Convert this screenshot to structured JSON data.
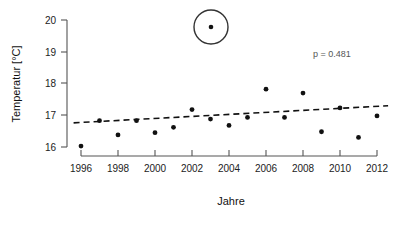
{
  "chart_data": {
    "type": "scatter",
    "title": "",
    "xlabel": "Jahre",
    "ylabel": "Temperatur [°C]",
    "xlim": [
      1995.2,
      2012.8
    ],
    "ylim": [
      15.72,
      20.0
    ],
    "grid": false,
    "legend": "none",
    "x_ticks": [
      1996,
      1998,
      2000,
      2002,
      2004,
      2006,
      2008,
      2010,
      2012
    ],
    "x_tick_labels": [
      "1996",
      "1998",
      "2000",
      "2002",
      "2004",
      "2006",
      "2008",
      "2010",
      "2012"
    ],
    "y_ticks": [
      16,
      17,
      18,
      19,
      20
    ],
    "y_tick_labels": [
      "16",
      "17",
      "18",
      "19",
      "20"
    ],
    "series": [
      {
        "name": "Jahresmitteltemperatur",
        "marker": "filled-circle",
        "color": "#111111",
        "x": [
          1996,
          1997,
          1998,
          1999,
          2000,
          2001,
          2002,
          2003,
          2004,
          2005,
          2006,
          2007,
          2008,
          2009,
          2010,
          2011,
          2012
        ],
        "values": [
          16.03,
          16.83,
          16.38,
          16.83,
          16.45,
          16.62,
          17.18,
          16.88,
          16.68,
          16.93,
          17.82,
          16.93,
          17.7,
          16.48,
          17.23,
          16.3,
          16.98
        ]
      }
    ],
    "trend_line": {
      "name": "Linearer Trend",
      "style": "dashed",
      "color": "#111111",
      "x_start": 1995.6,
      "y_start": 16.76,
      "x_end": 2012.6,
      "y_end": 17.3
    },
    "annotations": [
      {
        "name": "p-value",
        "text": "p = 0.481",
        "x_px": 332,
        "y_px": 57
      },
      {
        "name": "legend-symbol-circled-point",
        "shape": "circle-with-center-dot",
        "cx_px": 211,
        "cy_px": 27,
        "r_px": 17
      }
    ]
  },
  "axes": {
    "y_label": "Temperatur [°C]",
    "x_label": "Jahre"
  }
}
